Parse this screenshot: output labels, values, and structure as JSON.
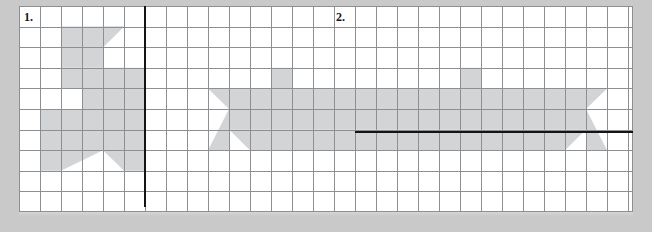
{
  "worksheet": {
    "background_color": "#c9c9c9",
    "page_color": "#ffffff",
    "grid_line_color": "#8c8f94",
    "shape_fill_color": "#d2d4d6",
    "mirror_line_color": "#141414",
    "grid": {
      "columns": 29,
      "rows": 10,
      "cell_width_px": 21,
      "cell_height_px": 20.6
    },
    "problems": [
      {
        "label": "1.",
        "figure_name": "star-half",
        "mirror_line": {
          "orientation": "vertical",
          "x_cell": 6
        },
        "description": "Half of a five-pointed star shaded on grid, vertical mirror line"
      },
      {
        "label": "2.",
        "figure_name": "boat",
        "mirror_line": {
          "orientation": "horizontal",
          "y_cell": 6
        },
        "description": "Boat hull with two masts shaded on grid, horizontal mirror line"
      }
    ]
  }
}
